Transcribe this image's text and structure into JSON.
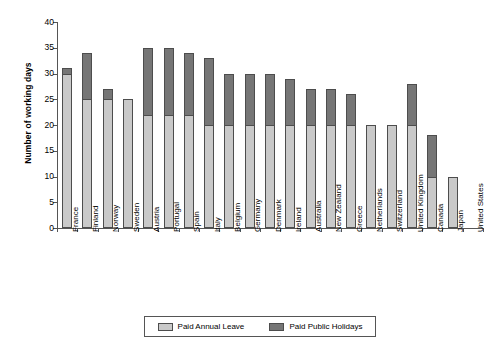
{
  "chart_data": {
    "type": "bar",
    "subtype": "stacked-vertical",
    "title": "",
    "xlabel": "",
    "ylabel": "Number of working days",
    "ylim": [
      0,
      40
    ],
    "ytick_step": 5,
    "yticks": [
      0,
      5,
      10,
      15,
      20,
      25,
      30,
      35,
      40
    ],
    "grid": false,
    "legend_position": "bottom",
    "categories": [
      "France",
      "Finland",
      "Norway",
      "Sweden",
      "Austria",
      "Portugal",
      "Spain",
      "Italy",
      "Belgium",
      "Germany",
      "Denmark",
      "Ireland",
      "Australia",
      "New Zealand",
      "Greece",
      "Netherlands",
      "Switzerland",
      "United Kingdom",
      "Canada",
      "Japan",
      "United States"
    ],
    "series": [
      {
        "name": "Paid Annual Leave",
        "color": "#c9c9c9",
        "values": [
          30,
          25,
          25,
          25,
          22,
          22,
          22,
          20,
          20,
          20,
          20,
          20,
          20,
          20,
          20,
          20,
          20,
          20,
          10,
          10,
          0
        ]
      },
      {
        "name": "Paid Public Holidays",
        "color": "#767676",
        "values": [
          1,
          9,
          2,
          0,
          13,
          13,
          12,
          13,
          10,
          10,
          10,
          9,
          7,
          7,
          6,
          0,
          0,
          8,
          8,
          0,
          0
        ]
      }
    ],
    "totals": [
      31,
      34,
      27,
      25,
      35,
      35,
      34,
      33,
      30,
      30,
      30,
      29,
      27,
      27,
      26,
      20,
      20,
      28,
      18,
      10,
      0
    ]
  },
  "legend": {
    "entries": [
      {
        "label": "Paid Annual Leave",
        "color": "#c9c9c9"
      },
      {
        "label": "Paid Public Holidays",
        "color": "#767676"
      }
    ]
  }
}
